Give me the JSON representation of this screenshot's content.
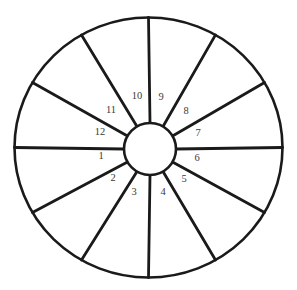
{
  "diagram": {
    "type": "radial-sector-wheel",
    "background_color": "#ffffff",
    "stroke_color": "#1a1a1a",
    "label_color": "#3a3a3a",
    "outer_circle": {
      "center_x": 148.5,
      "center_y": 147.5,
      "radius_x": 134,
      "radius_y": 130,
      "stroke_width": 2.6
    },
    "hub_circle": {
      "center_x": 150,
      "center_y": 149,
      "radius": 26,
      "stroke_width": 2.6
    },
    "spoke_count": 12,
    "spoke_angle_step_degrees": 30,
    "spoke_stroke_width": 2.8,
    "spokes": [
      {
        "angle_degrees": 0
      },
      {
        "angle_degrees": 30
      },
      {
        "angle_degrees": 60
      },
      {
        "angle_degrees": 90
      },
      {
        "angle_degrees": 120
      },
      {
        "angle_degrees": 150
      },
      {
        "angle_degrees": 180
      },
      {
        "angle_degrees": 210
      },
      {
        "angle_degrees": 240
      },
      {
        "angle_degrees": 270
      },
      {
        "angle_degrees": 300
      },
      {
        "angle_degrees": 330
      }
    ],
    "sectors": [
      {
        "label": "1",
        "x": 101,
        "y": 157
      },
      {
        "label": "2",
        "x": 113,
        "y": 179
      },
      {
        "label": "3",
        "x": 134,
        "y": 193
      },
      {
        "label": "4",
        "x": 163,
        "y": 193
      },
      {
        "label": "5",
        "x": 184,
        "y": 180
      },
      {
        "label": "6",
        "x": 197,
        "y": 159
      },
      {
        "label": "7",
        "x": 198,
        "y": 134
      },
      {
        "label": "8",
        "x": 186,
        "y": 112
      },
      {
        "label": "9",
        "x": 161,
        "y": 98
      },
      {
        "label": "10",
        "x": 137,
        "y": 97
      },
      {
        "label": "11",
        "x": 111,
        "y": 111
      },
      {
        "label": "12",
        "x": 100,
        "y": 133
      }
    ]
  }
}
